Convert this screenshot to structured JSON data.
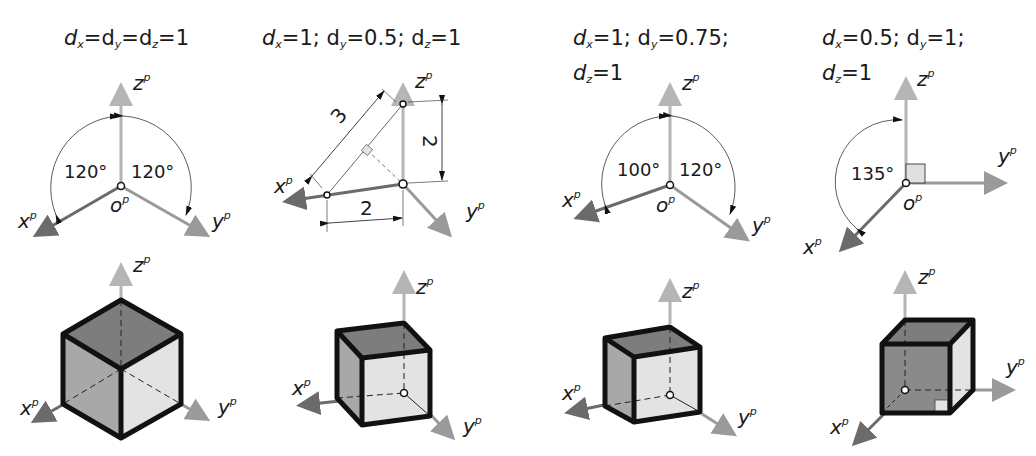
{
  "colors": {
    "axis_x": "#6b6b6b",
    "axis_y": "#9a9a9a",
    "axis_z": "#b5b5b5",
    "face_dark": "#7d7d7d",
    "face_mid": "#a8a8a8",
    "face_light": "#e3e3e3",
    "edge": "#111111"
  },
  "panels": [
    {
      "title": {
        "d1": "d",
        "s1": "x",
        "t1": "=",
        "d2": "d",
        "s2": "y",
        "t2": "=",
        "d3": "d",
        "s3": "z",
        "t3": "=1",
        "line2": ""
      },
      "title_text": "dx=dy=dz=1",
      "axes": {
        "x": "x",
        "y": "y",
        "z": "z",
        "o": "o",
        "sup": "p"
      },
      "angles": [
        "120°",
        "120°"
      ],
      "cube": "isometric"
    },
    {
      "title_text": "dx=1; dy=0.5; dz=1",
      "axes": {
        "x": "x",
        "y": "y",
        "z": "z",
        "sup": "p"
      },
      "dimensions": [
        "3",
        "2",
        "2"
      ],
      "cube": "dimetric"
    },
    {
      "title_text": "dx=1; dy=0.75; dz=1",
      "axes": {
        "x": "x",
        "y": "y",
        "z": "z",
        "o": "o",
        "sup": "p"
      },
      "angles": [
        "100°",
        "120°"
      ],
      "cube": "trimetric"
    },
    {
      "title_text": "dx=0.5; dy=1; dz=1",
      "axes": {
        "x": "x",
        "y": "y",
        "z": "z",
        "o": "o",
        "sup": "p"
      },
      "angles": [
        "135°"
      ],
      "cube": "cabinet-oblique"
    }
  ],
  "titles": {
    "p1": {
      "a": "d",
      "as": "x",
      "b": "=d",
      "bs": "y",
      "c": "=d",
      "cs": "z",
      "d": "=1"
    },
    "p2": {
      "a": "d",
      "as": "x",
      "b": "=1; d",
      "bs": "y",
      "c": "=0.5; d",
      "cs": "z",
      "d": "=1"
    },
    "p3": {
      "a": "d",
      "as": "x",
      "b": "=1; d",
      "bs": "y",
      "c": "=0.75;",
      "l2a": "d",
      "l2s": "z",
      "l2b": "=1"
    },
    "p4": {
      "a": "d",
      "as": "x",
      "b": "=0.5; d",
      "bs": "y",
      "c": "=1;",
      "l2a": "d",
      "l2s": "z",
      "l2b": "=1"
    }
  },
  "labels": {
    "x": "x",
    "y": "y",
    "z": "z",
    "o": "o",
    "p": "p"
  },
  "angles": {
    "a120": "120°",
    "a100": "100°",
    "a135": "135°"
  },
  "dims": {
    "three": "3",
    "two": "2"
  }
}
